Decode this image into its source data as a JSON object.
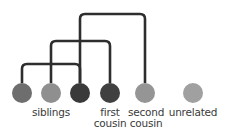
{
  "diagram": {
    "type": "relatedness-tree",
    "line_color": "#2e2e2e",
    "nodes": [
      {
        "id": "n1",
        "cx": 22,
        "cy": 93,
        "r": 10,
        "color": "#6e6e6e"
      },
      {
        "id": "n2",
        "cx": 51,
        "cy": 93,
        "r": 10,
        "color": "#8f8f8f"
      },
      {
        "id": "n3",
        "cx": 80,
        "cy": 93,
        "r": 10,
        "color": "#3a3a3a"
      },
      {
        "id": "n4",
        "cx": 110,
        "cy": 93,
        "r": 10,
        "color": "#404040"
      },
      {
        "id": "n5",
        "cx": 145,
        "cy": 93,
        "r": 10,
        "color": "#959595"
      },
      {
        "id": "n6",
        "cx": 193,
        "cy": 93,
        "r": 10,
        "color": "#a0a0a0"
      }
    ],
    "brackets": [
      {
        "id": "siblings-bracket",
        "x1": 22,
        "x2": 80,
        "y": 64,
        "bottom": 83
      },
      {
        "id": "first-cousin-bracket",
        "x1": 51,
        "x2": 110,
        "y": 41,
        "bottom": 83
      },
      {
        "id": "second-cousin-bracket",
        "x1": 80,
        "x2": 145,
        "y": 14,
        "bottom": 83
      }
    ],
    "labels": {
      "siblings": "siblings",
      "first_cousin_line1": "first",
      "first_cousin_line2": "cousin",
      "second_cousin_line1": "second",
      "second_cousin_line2": "cousin",
      "unrelated": "unrelated"
    }
  }
}
